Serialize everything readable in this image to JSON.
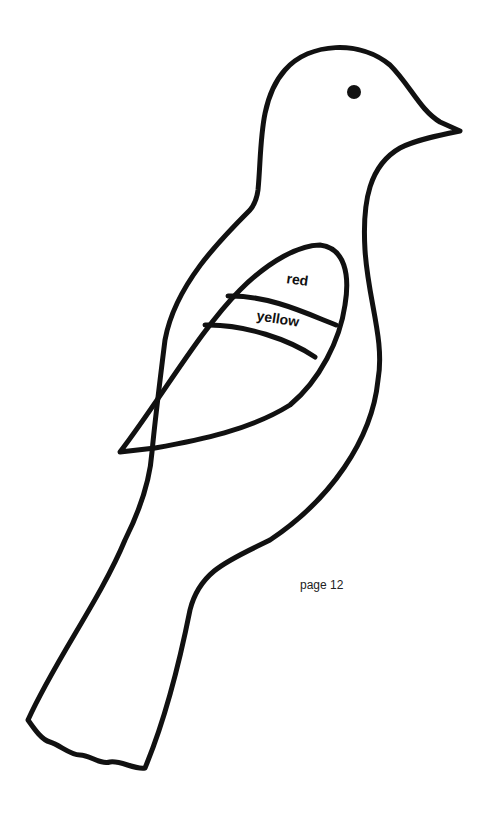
{
  "drawing": {
    "subject": "bird outline coloring template",
    "stroke_color": "#111111",
    "background": "#ffffff",
    "wing_labels": {
      "top_band": "red",
      "middle_band": "yellow"
    }
  },
  "footer": {
    "page_label": "page 12"
  }
}
